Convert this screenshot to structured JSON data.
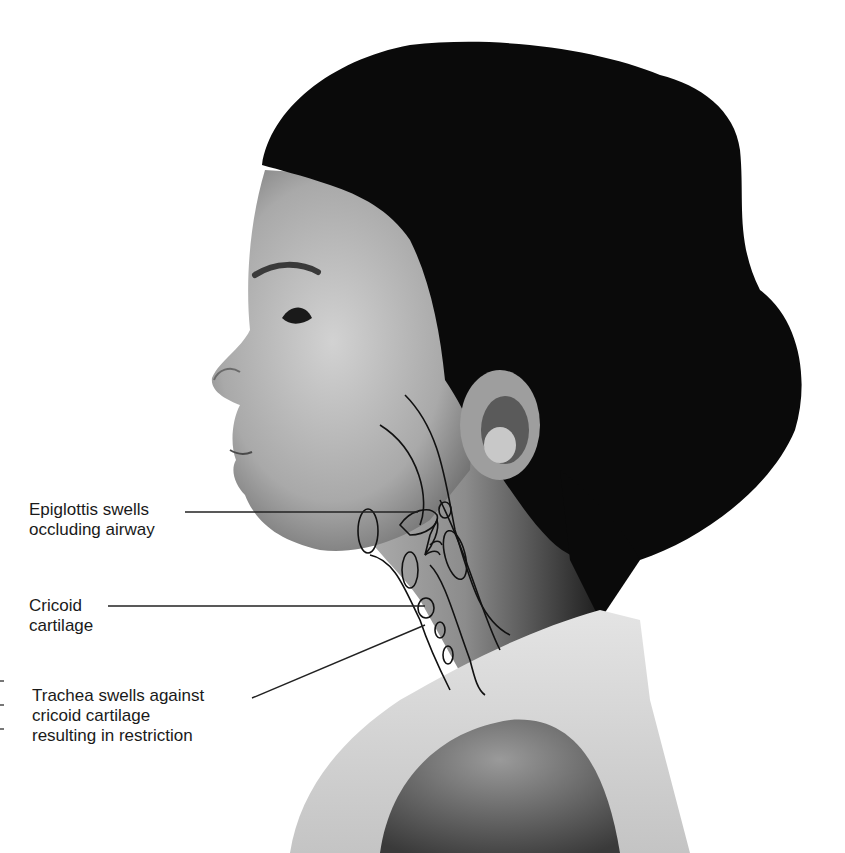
{
  "figure": {
    "description_alt": "Side profile of a child with anatomical overlay of the airway in the neck",
    "colors": {
      "background": "#ffffff",
      "hair": "#0a0a0a",
      "skin_light": "#c9c9c9",
      "skin_mid": "#8e8e8e",
      "shirt": "#d8d8d8",
      "line_art": "#111111",
      "label_text": "#1a1a1a"
    }
  },
  "labels": [
    {
      "id": "epiglottis",
      "lines": [
        "Epiglottis swells",
        "occluding airway"
      ]
    },
    {
      "id": "cricoid",
      "lines": [
        "Cricoid",
        "cartilage"
      ]
    },
    {
      "id": "trachea",
      "lines": [
        "Trachea swells against",
        "cricoid cartilage",
        "resulting in restriction"
      ]
    }
  ]
}
